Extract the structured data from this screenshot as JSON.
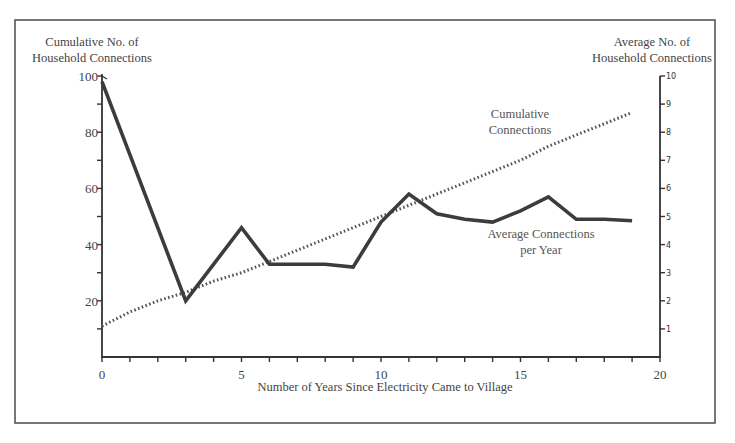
{
  "chart_data": {
    "type": "line",
    "title": "",
    "xlabel": "Number of Years Since Electricity Came to Village",
    "ylabel_left": [
      "Cumulative No. of",
      "Household Connections"
    ],
    "ylabel_right": [
      "Average No. of",
      "Household Connections"
    ],
    "xlim": [
      0,
      20
    ],
    "ylim_left": [
      0,
      100
    ],
    "ylim_right": [
      0,
      10
    ],
    "x_ticks": [
      0,
      5,
      10,
      15,
      20
    ],
    "x_minor_ticks": [
      1,
      2,
      3,
      4,
      6,
      7,
      8,
      9,
      11,
      12,
      13,
      14,
      16,
      17,
      18,
      19
    ],
    "y_left_ticks": [
      20,
      40,
      60,
      80,
      100
    ],
    "y_left_minor_ticks": [
      10,
      30,
      50,
      70,
      90
    ],
    "y_right_ticks": [
      1,
      2,
      3,
      4,
      5,
      6,
      7,
      8,
      9,
      10
    ],
    "grid": false,
    "legend": "inline annotations",
    "series": [
      {
        "name": "Cumulative Connections",
        "axis": "left",
        "style": "dotted",
        "label_lines": [
          "Cumulative",
          "Connections"
        ],
        "x": [
          0,
          1,
          2,
          3,
          4,
          5,
          6,
          7,
          8,
          9,
          10,
          11,
          12,
          13,
          14,
          15,
          16,
          17,
          18,
          19
        ],
        "values": [
          11,
          16,
          20,
          23,
          27,
          30,
          34,
          38,
          42,
          46,
          50,
          54,
          58,
          62,
          66,
          70,
          75,
          79,
          83,
          87
        ]
      },
      {
        "name": "Average Connections per Year",
        "axis": "right",
        "style": "solid",
        "label_lines": [
          "Average Connections",
          "per Year"
        ],
        "x": [
          0,
          3,
          5,
          6,
          7,
          8,
          9,
          10,
          11,
          12,
          13,
          14,
          15,
          16,
          17,
          18,
          19
        ],
        "values": [
          9.8,
          2.0,
          4.6,
          3.3,
          3.3,
          3.3,
          3.2,
          4.8,
          5.8,
          5.1,
          4.9,
          4.8,
          5.2,
          5.7,
          4.9,
          4.9,
          4.85
        ]
      }
    ]
  }
}
